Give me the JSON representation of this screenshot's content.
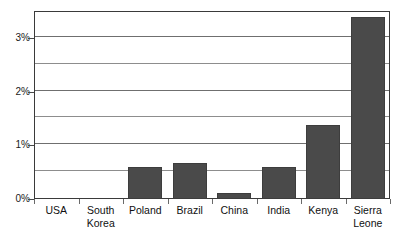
{
  "chart_data": {
    "type": "bar",
    "title": "",
    "subtitle": "",
    "xlabel": "",
    "ylabel": "",
    "categories": [
      "USA",
      "South Korea",
      "Poland",
      "Brazil",
      "China",
      "India",
      "Kenya",
      "Sierra Leone"
    ],
    "values": [
      0,
      0,
      0.6,
      0.67,
      0.11,
      0.6,
      1.38,
      3.39
    ],
    "value_unit": "%",
    "ylim": [
      0,
      3.5
    ],
    "ytick_labels": [
      "0%",
      "1%",
      "2%",
      "3%"
    ],
    "ytick_values": [
      0,
      1,
      2,
      3
    ],
    "minor_gridline_values": [
      0.5,
      1.5,
      2.5,
      3.5
    ],
    "grid": "horizontal",
    "legend": "none",
    "bar_color": "#4a4a4a",
    "background_color": "#ffffff",
    "axis_color": "#3a3a3a",
    "annotations": []
  },
  "axis": {
    "y_ticks": [
      {
        "label": "3%",
        "value": 3
      },
      {
        "label": "2%",
        "value": 2
      },
      {
        "label": "1%",
        "value": 1
      },
      {
        "label": "0%",
        "value": 0
      }
    ],
    "x_categories": [
      {
        "label": "USA",
        "value": 0
      },
      {
        "label": "South\nKorea",
        "value": 0
      },
      {
        "label": "Poland",
        "value": 0.6
      },
      {
        "label": "Brazil",
        "value": 0.67
      },
      {
        "label": "China",
        "value": 0.11
      },
      {
        "label": "India",
        "value": 0.6
      },
      {
        "label": "Kenya",
        "value": 1.38
      },
      {
        "label": "Sierra\nLeone",
        "value": 3.39
      }
    ]
  }
}
